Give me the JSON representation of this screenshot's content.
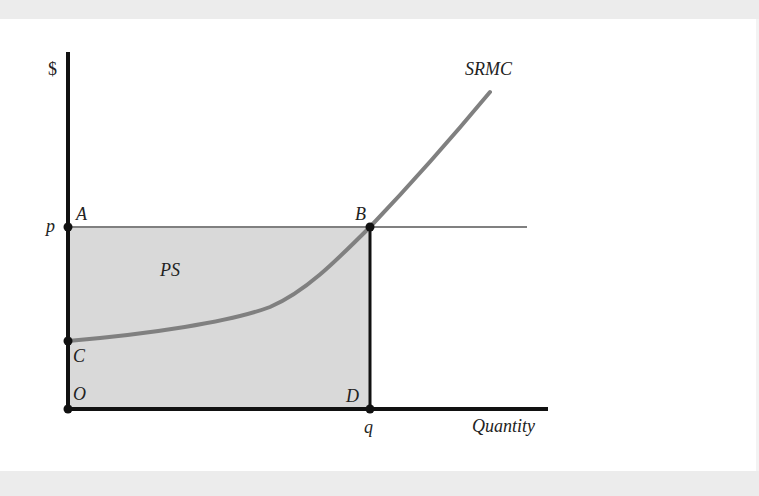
{
  "figure": {
    "y_axis_label": "$",
    "x_axis_label": "Quantity",
    "curve_label": "SRMC",
    "region_label": "PS",
    "points": {
      "A": "A",
      "B": "B",
      "C": "C",
      "D": "D",
      "O": "O"
    },
    "price_tick": "p",
    "quantity_tick": "q"
  },
  "colors": {
    "background": "#ffffff",
    "frame_band": "#ececec",
    "shaded_region": "#d9d9d9",
    "axis": "#111111",
    "curve": "#808080",
    "price_line": "#808080",
    "point": "#111111"
  }
}
